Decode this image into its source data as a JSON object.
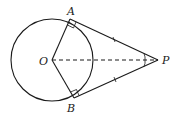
{
  "diagram": {
    "title": "",
    "points": {
      "O": {
        "label": "O"
      },
      "A": {
        "label": "A"
      },
      "B": {
        "label": "B"
      },
      "P": {
        "label": "P"
      }
    },
    "stroke_color": "#1a1a1a"
  }
}
